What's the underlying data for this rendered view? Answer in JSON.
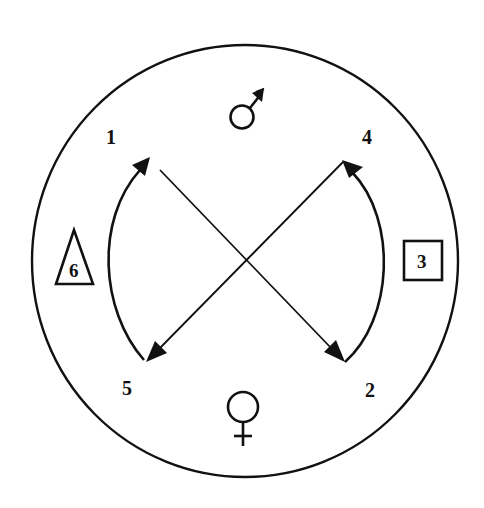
{
  "diagram": {
    "type": "circular-cross-diagram",
    "colors": {
      "stroke": "#111111",
      "background": "#ffffff"
    },
    "symbols": {
      "top": "male-symbol",
      "bottom": "female-symbol"
    },
    "labels": {
      "n1": "1",
      "n2": "2",
      "n4": "4",
      "n5": "5"
    },
    "shapes": {
      "triangle_label": "6",
      "box_label": "3"
    },
    "connections": [
      {
        "from": "1",
        "to": "2",
        "type": "straight-double-arrow"
      },
      {
        "from": "4",
        "to": "5",
        "type": "straight-double-arrow"
      },
      {
        "from": "5",
        "to": "1",
        "type": "curved-arrow"
      },
      {
        "from": "2",
        "to": "4",
        "type": "curved-arrow"
      }
    ]
  }
}
